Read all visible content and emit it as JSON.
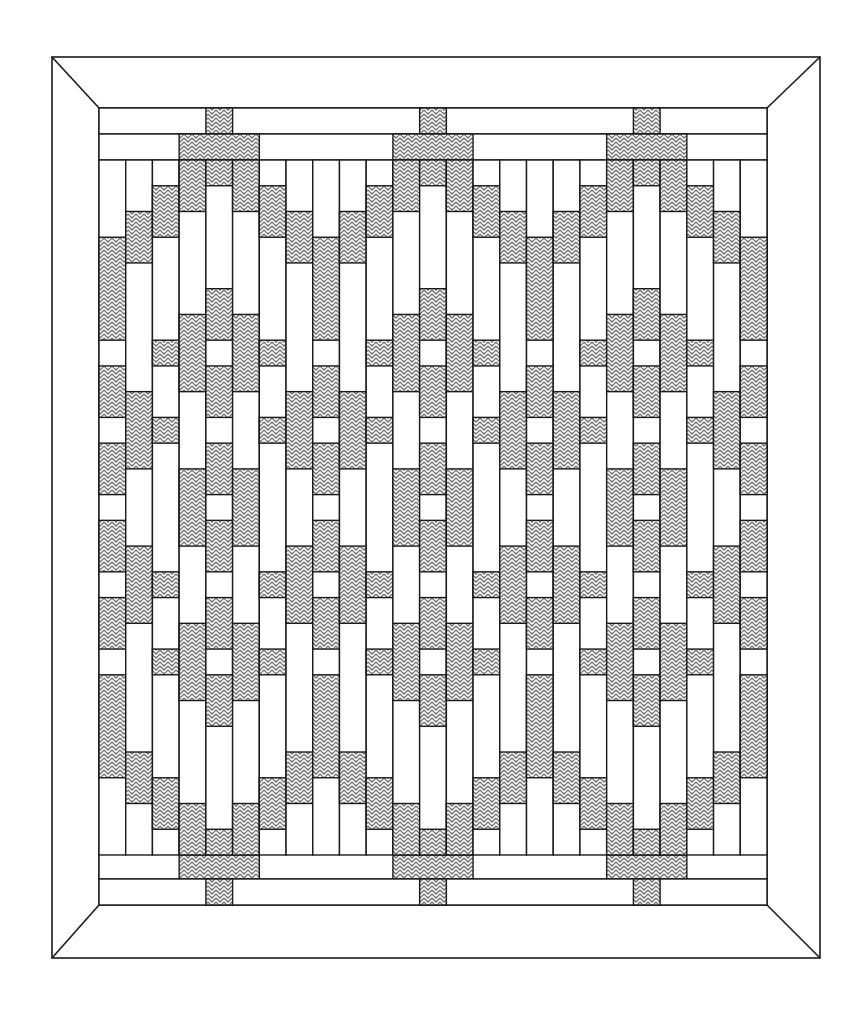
{
  "diagram": {
    "type": "quilt-pattern",
    "colors": {
      "background": "#ffffff",
      "line": "#1a1a1a",
      "hatch_stroke": "#6e6e6e",
      "patch_fill": "#ffffff"
    },
    "frame": {
      "outer": {
        "x": 52,
        "y": 57,
        "w": 768,
        "h": 901
      },
      "inner": {
        "x": 99,
        "y": 108,
        "w": 668,
        "h": 797
      },
      "mitered_corners": true
    },
    "grid": {
      "columns": 25,
      "col_width": 26.72,
      "field_top": 160,
      "field_rows": 27,
      "row_height": 25.74,
      "motif_period_columns": 8,
      "motif_centers_columns": [
        4,
        12,
        20
      ]
    },
    "top_strips": [
      {
        "y": 108,
        "h": 26,
        "hatched_cols": [
          [
            4,
            5
          ],
          [
            12,
            13
          ],
          [
            20,
            21
          ]
        ]
      },
      {
        "y": 134,
        "h": 26,
        "hatched_cols": [
          [
            3,
            6
          ],
          [
            11,
            14
          ],
          [
            19,
            22
          ]
        ]
      }
    ],
    "bottom_strips": [
      {
        "y": 853,
        "h": 26,
        "hatched_cols": [
          [
            3,
            6
          ],
          [
            11,
            14
          ],
          [
            19,
            22
          ]
        ]
      },
      {
        "y": 879,
        "h": 26,
        "hatched_cols": [
          [
            4,
            5
          ],
          [
            12,
            13
          ],
          [
            20,
            21
          ]
        ]
      }
    ],
    "column_patterns": {
      "note": "Hatched row ranges [start,end) for columns 0-7 of the 8-column motif; columns repeat with period 8 (col 24 = col 0).",
      "0": [
        [
          3,
          7
        ],
        [
          8,
          10
        ],
        [
          11,
          13
        ],
        [
          14,
          16
        ],
        [
          17,
          19
        ],
        [
          20,
          24
        ]
      ],
      "1": [
        [
          2,
          4
        ],
        [
          9,
          12
        ],
        [
          15,
          18
        ],
        [
          23,
          25
        ]
      ],
      "2": [
        [
          1,
          3
        ],
        [
          7,
          8
        ],
        [
          10,
          11
        ],
        [
          16,
          17
        ],
        [
          19,
          20
        ],
        [
          24,
          26
        ]
      ],
      "3": [
        [
          0,
          2
        ],
        [
          6,
          9
        ],
        [
          12,
          15
        ],
        [
          18,
          21
        ],
        [
          25,
          27
        ]
      ],
      "4": [
        [
          0,
          1
        ],
        [
          5,
          7
        ],
        [
          8,
          10
        ],
        [
          11,
          13
        ],
        [
          14,
          16
        ],
        [
          17,
          19
        ],
        [
          20,
          22
        ],
        [
          26,
          27
        ]
      ],
      "5": [
        [
          0,
          2
        ],
        [
          6,
          9
        ],
        [
          12,
          15
        ],
        [
          18,
          21
        ],
        [
          25,
          27
        ]
      ],
      "6": [
        [
          1,
          3
        ],
        [
          7,
          8
        ],
        [
          10,
          11
        ],
        [
          16,
          17
        ],
        [
          19,
          20
        ],
        [
          24,
          26
        ]
      ],
      "7": [
        [
          2,
          4
        ],
        [
          9,
          12
        ],
        [
          15,
          18
        ],
        [
          23,
          25
        ]
      ]
    }
  }
}
